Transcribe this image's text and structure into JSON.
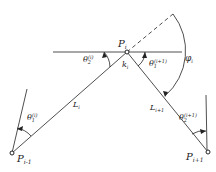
{
  "diagram": {
    "points": {
      "prev": {
        "base": "P",
        "sub": "i-1"
      },
      "center": {
        "base": "P",
        "sub": "i"
      },
      "next": {
        "base": "P",
        "sub": "i+1"
      }
    },
    "segments": {
      "left": {
        "base": "L",
        "sub": "i"
      },
      "right": {
        "base": "L",
        "sub": "i+1"
      }
    },
    "angles": {
      "theta2_i": {
        "base": "θ",
        "sub": "2",
        "sup": "(i)"
      },
      "theta1_i1": {
        "base": "θ",
        "sub": "1",
        "sup": "(i+1)"
      },
      "theta1_i": {
        "base": "θ",
        "sub": "1",
        "sup": "(i)"
      },
      "theta2_i1": {
        "base": "θ",
        "sub": "2",
        "sup": "(i+1)"
      },
      "phi": {
        "base": "φ",
        "sub": "i"
      },
      "k": {
        "base": "k",
        "sub": "i"
      }
    }
  }
}
